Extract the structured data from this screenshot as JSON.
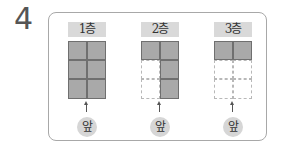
{
  "question_number": "4",
  "floors": [
    {
      "label": "1층",
      "front_label": "앞",
      "cells": [
        "filled",
        "filled",
        "filled",
        "filled",
        "filled",
        "filled"
      ]
    },
    {
      "label": "2층",
      "front_label": "앞",
      "cells": [
        "filled",
        "filled",
        "empty",
        "filled",
        "empty",
        "filled"
      ]
    },
    {
      "label": "3층",
      "front_label": "앞",
      "cells": [
        "filled",
        "filled",
        "empty",
        "empty",
        "empty",
        "empty"
      ]
    }
  ],
  "colors": {
    "filled": "#a9a9a9",
    "label_bg": "#d9d9d9",
    "border": "#a8a8a8"
  }
}
